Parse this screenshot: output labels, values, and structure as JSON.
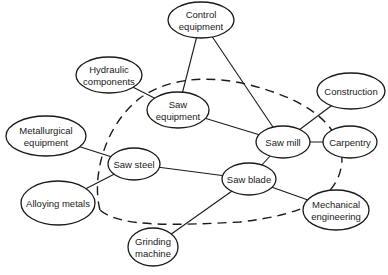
{
  "diagram": {
    "type": "network",
    "nodes": [
      {
        "id": "control",
        "lines": [
          "Control",
          "equipment"
        ],
        "cx": 201,
        "cy": 20,
        "rx": 33,
        "ry": 18
      },
      {
        "id": "hydraulic",
        "lines": [
          "Hydraulic",
          "components"
        ],
        "cx": 109,
        "cy": 75,
        "rx": 33,
        "ry": 18
      },
      {
        "id": "saw_equipment",
        "lines": [
          "Saw",
          "equipment"
        ],
        "cx": 178,
        "cy": 110,
        "rx": 31,
        "ry": 18
      },
      {
        "id": "construction",
        "lines": [
          "Construction"
        ],
        "cx": 351,
        "cy": 91,
        "rx": 34,
        "ry": 18
      },
      {
        "id": "metallurgical",
        "lines": [
          "Metallurgical",
          "equipment"
        ],
        "cx": 46,
        "cy": 136,
        "rx": 40,
        "ry": 20
      },
      {
        "id": "saw_mill",
        "lines": [
          "Saw mill"
        ],
        "cx": 283,
        "cy": 142,
        "rx": 27,
        "ry": 16
      },
      {
        "id": "carpentry",
        "lines": [
          "Carpentry"
        ],
        "cx": 350,
        "cy": 142,
        "rx": 27,
        "ry": 16
      },
      {
        "id": "saw_steel",
        "lines": [
          "Saw steel"
        ],
        "cx": 134,
        "cy": 164,
        "rx": 26,
        "ry": 16
      },
      {
        "id": "saw_blade",
        "lines": [
          "Saw blade"
        ],
        "cx": 249,
        "cy": 179,
        "rx": 27,
        "ry": 16
      },
      {
        "id": "alloying",
        "lines": [
          "Alloying metals"
        ],
        "cx": 58,
        "cy": 203,
        "rx": 37,
        "ry": 22
      },
      {
        "id": "mechanical",
        "lines": [
          "Mechanical",
          "engineering"
        ],
        "cx": 336,
        "cy": 210,
        "rx": 33,
        "ry": 20
      },
      {
        "id": "grinding",
        "lines": [
          "Grinding",
          "machine"
        ],
        "cx": 153,
        "cy": 247,
        "rx": 25,
        "ry": 19
      }
    ],
    "edges": [
      [
        "control",
        "saw_equipment"
      ],
      [
        "control",
        "saw_mill"
      ],
      [
        "hydraulic",
        "saw_equipment"
      ],
      [
        "saw_equipment",
        "saw_mill"
      ],
      [
        "construction",
        "saw_mill"
      ],
      [
        "saw_mill",
        "carpentry"
      ],
      [
        "saw_mill",
        "saw_blade"
      ],
      [
        "metallurgical",
        "saw_steel"
      ],
      [
        "alloying",
        "saw_steel"
      ],
      [
        "saw_steel",
        "saw_blade"
      ],
      [
        "saw_blade",
        "mechanical"
      ],
      [
        "saw_blade",
        "grinding"
      ]
    ],
    "boundary": {
      "style": "dashed",
      "encloses": [
        "saw_equipment",
        "saw_mill",
        "saw_steel",
        "saw_blade"
      ]
    }
  }
}
